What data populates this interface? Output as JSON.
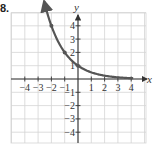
{
  "problem_label": "8.",
  "chart_data": {
    "type": "line",
    "title": "",
    "xlabel": "x",
    "ylabel": "y",
    "xlim": [
      -4,
      4
    ],
    "ylim": [
      -5,
      5
    ],
    "grid": true,
    "x_ticks": [
      -4,
      -3,
      -2,
      -1,
      1,
      2,
      3,
      4
    ],
    "x_tick_labels": [
      "−4",
      "−3",
      "−2",
      "−1",
      "1",
      "2",
      "3",
      "4"
    ],
    "y_ticks": [
      4,
      3,
      2,
      1,
      -1,
      -2,
      -3,
      -4
    ],
    "y_tick_labels": [
      "4",
      "3",
      "2",
      "1",
      "−1",
      "−2",
      "−3",
      "−4"
    ],
    "series": [
      {
        "name": "y = (1/2)^x",
        "function": "0.5^x",
        "color": "#555555",
        "points": [
          {
            "x": -2,
            "y": 4
          },
          {
            "x": -1,
            "y": 2
          },
          {
            "x": 0,
            "y": 1
          },
          {
            "x": 1,
            "y": 0.5
          },
          {
            "x": 2,
            "y": 0.25
          },
          {
            "x": 3,
            "y": 0.125
          },
          {
            "x": 4,
            "y": 0.0625
          }
        ],
        "marked_points": [
          {
            "x": -2,
            "y": 4
          },
          {
            "x": -1,
            "y": 2
          },
          {
            "x": 0,
            "y": 1
          }
        ]
      }
    ]
  }
}
